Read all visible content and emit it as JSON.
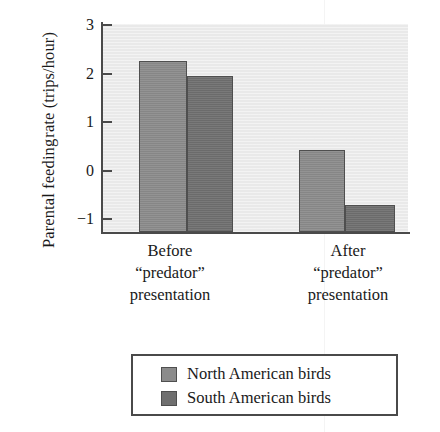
{
  "chart_data": {
    "type": "bar",
    "title": "",
    "subtitle": "",
    "xlabel": "",
    "ylabel_lines": [
      "Parental feeding",
      "rate (trips/hour)"
    ],
    "ylabel": "Parental feeding rate (trips/hour)",
    "categories": [
      "Before “predator” presentation",
      "After “predator” presentation"
    ],
    "category_lines": [
      [
        "Before",
        "“predator”",
        "presentation"
      ],
      [
        "After",
        "“predator”",
        "presentation"
      ]
    ],
    "series": [
      {
        "name": "North American birds",
        "color": "#8b8b8b",
        "values": [
          2.23,
          0.4
        ]
      },
      {
        "name": "South American birds",
        "color": "#6f6f6f",
        "values": [
          1.92,
          -0.72
        ]
      }
    ],
    "ylim": [
      -1.28,
      3
    ],
    "yticks": [
      3,
      2,
      1,
      0,
      -1
    ],
    "ytick_labels": [
      "3",
      "2",
      "1",
      "0",
      "−1"
    ],
    "grid": false,
    "legend_position": "bottom",
    "plot_background": "#e9e9e9",
    "axis_color": "#4a4a4a"
  },
  "legend": {
    "entries": [
      {
        "label": "North American birds",
        "color": "#8b8b8b"
      },
      {
        "label": "South American birds",
        "color": "#6f6f6f"
      }
    ]
  }
}
